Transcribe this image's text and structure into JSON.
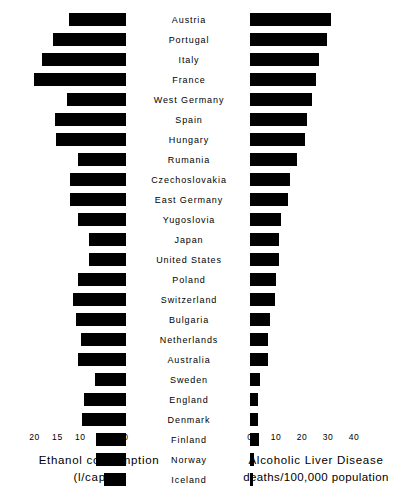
{
  "chart_data": {
    "type": "bar",
    "title": "",
    "orientation": "horizontal",
    "layout": "paired back-to-back bar chart, shared country category axis in the center",
    "categories": [
      "Austria",
      "Portugal",
      "Italy",
      "France",
      "West Germany",
      "Spain",
      "Hungary",
      "Rumania",
      "Czechoslovakia",
      "East Germany",
      "Yugoslovia",
      "Japan",
      "United States",
      "Poland",
      "Switzerland",
      "Bulgaria",
      "Netherlands",
      "Australia",
      "Sweden",
      "England",
      "Denmark",
      "Finland",
      "Norway",
      "Iceland"
    ],
    "series": [
      {
        "name": "Ethanol consumption",
        "units": "l/capita",
        "side": "left",
        "direction": "right-to-left",
        "xlabel": "Ethanol consumption (l/capita)",
        "xlim": [
          0,
          21
        ],
        "axis_reversed": true,
        "ticks": [
          20,
          15,
          10,
          5,
          0
        ],
        "values": [
          12.5,
          16.0,
          18.3,
          20.2,
          13.0,
          15.5,
          15.3,
          10.5,
          12.2,
          12.3,
          10.6,
          8.0,
          8.0,
          10.5,
          11.6,
          11.0,
          9.9,
          10.4,
          6.8,
          9.2,
          9.6,
          6.6,
          6.6,
          4.8
        ]
      },
      {
        "name": "Alcoholic Liver Disease",
        "units": "deaths/100,000 population",
        "side": "right",
        "direction": "left-to-right",
        "xlabel": "Alcoholic Liver Disease deaths/100,000 population",
        "xlim": [
          0,
          45
        ],
        "axis_reversed": false,
        "ticks": [
          0,
          10,
          20,
          30,
          40
        ],
        "values": [
          31.0,
          29.5,
          26.5,
          25.5,
          24.0,
          22.0,
          21.0,
          18.0,
          15.5,
          14.5,
          12.0,
          11.0,
          11.0,
          10.0,
          9.5,
          7.5,
          7.0,
          7.0,
          4.0,
          3.0,
          3.0,
          3.5,
          1.5,
          1.0
        ]
      }
    ],
    "grid": false,
    "legend": "none"
  },
  "left_axis": {
    "ticks": [
      {
        "label": "20",
        "value": 20
      },
      {
        "label": "15",
        "value": 15
      },
      {
        "label": "10",
        "value": 10
      },
      {
        "label": "5",
        "value": 5
      },
      {
        "label": "0",
        "value": 0
      }
    ],
    "caption_line1": "Ethanol consumption",
    "caption_line2": "(l/capita)"
  },
  "right_axis": {
    "ticks": [
      {
        "label": "0",
        "value": 0
      },
      {
        "label": "10",
        "value": 10
      },
      {
        "label": "20",
        "value": 20
      },
      {
        "label": "30",
        "value": 30
      },
      {
        "label": "40",
        "value": 40
      }
    ],
    "caption_line1": "Alcoholic Liver Disease",
    "caption_line2": "deaths/100,000  population"
  }
}
